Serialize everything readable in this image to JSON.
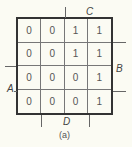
{
  "kmap": {
    "cells": [
      [
        "0",
        "0",
        "1",
        "1"
      ],
      [
        "0",
        "0",
        "1",
        "1"
      ],
      [
        "0",
        "0",
        "0",
        "1"
      ],
      [
        "0",
        "0",
        "0",
        "1"
      ]
    ]
  },
  "labels": {
    "A": "A",
    "B": "B",
    "C": "C",
    "D": "D"
  },
  "caption": "(a)"
}
